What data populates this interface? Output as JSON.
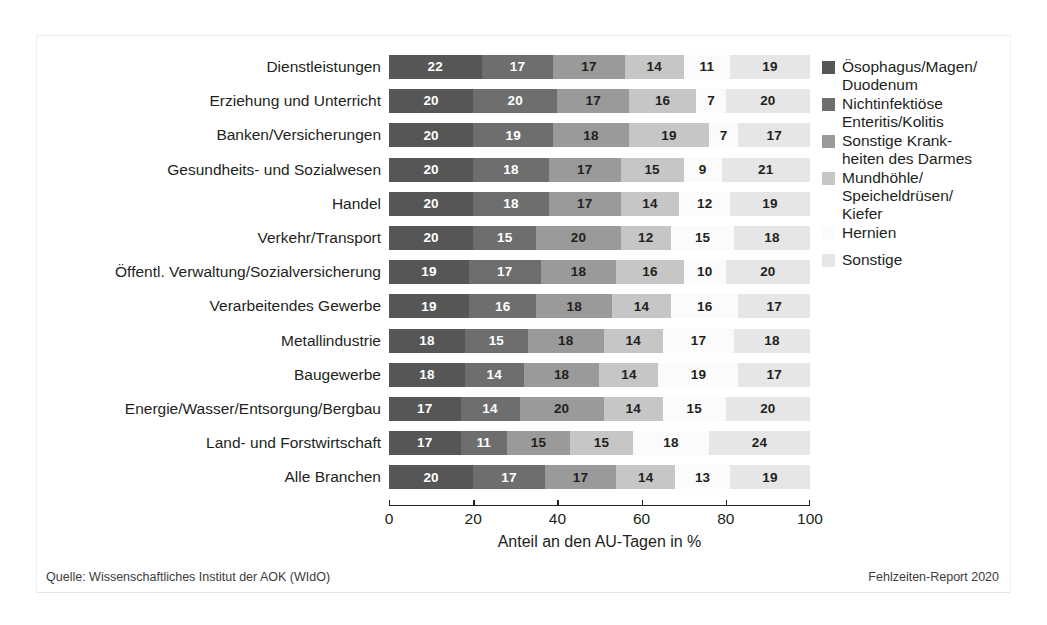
{
  "chart_data": {
    "type": "bar",
    "orientation": "horizontal",
    "stacked": true,
    "stack_mode": "percent",
    "title": "",
    "xlabel": "Anteil an den AU-Tagen in %",
    "ylabel": "",
    "xlim": [
      0,
      100
    ],
    "xticks": [
      0,
      20,
      40,
      60,
      80,
      100
    ],
    "xtick_labels": [
      "0",
      "20",
      "40",
      "60",
      "80",
      "100"
    ],
    "grid": false,
    "legend_position": "right",
    "categories": [
      "Dienstleistungen",
      "Erziehung und Unterricht",
      "Banken/Versicherungen",
      "Gesundheits- und Sozialwesen",
      "Handel",
      "Verkehr/Transport",
      "Öffentl. Verwaltung/Sozialversicherung",
      "Verarbeitendes Gewerbe",
      "Metallindustrie",
      "Baugewerbe",
      "Energie/Wasser/Entsorgung/Bergbau",
      "Land- und Forstwirtschaft",
      "Alle Branchen"
    ],
    "series": [
      {
        "name": "Ösophagus/Magen/Duodenum",
        "legend_label": "Ösophagus/Magen/\nDuodenum",
        "color": "#565656",
        "label_color": "#ffffff",
        "values": [
          22,
          20,
          20,
          20,
          20,
          20,
          19,
          19,
          18,
          18,
          17,
          17,
          20
        ]
      },
      {
        "name": "Nichtinfektiöse Enteritis/Kolitis",
        "legend_label": "Nichtinfektiöse\nEnteritis/Kolitis",
        "color": "#6e6e6e",
        "label_color": "#ffffff",
        "values": [
          17,
          20,
          19,
          18,
          18,
          15,
          17,
          16,
          15,
          14,
          14,
          11,
          17
        ]
      },
      {
        "name": "Sonstige Krankheiten des Darmes",
        "legend_label": "Sonstige Krank-\nheiten des Darmes",
        "color": "#9a9a9a",
        "label_color": "#231f20",
        "values": [
          17,
          17,
          18,
          17,
          17,
          20,
          18,
          18,
          18,
          18,
          20,
          15,
          17
        ]
      },
      {
        "name": "Mundhöhle/Speicheldrüsen/Kiefer",
        "legend_label": "Mundhöhle/\nSpeicheldrüsen/\nKiefer",
        "color": "#c6c6c6",
        "label_color": "#231f20",
        "values": [
          14,
          16,
          19,
          15,
          14,
          12,
          16,
          14,
          14,
          14,
          14,
          15,
          14
        ]
      },
      {
        "name": "Hernien",
        "legend_label": "Hernien",
        "color": "#fbfbfb",
        "label_color": "#231f20",
        "values": [
          11,
          7,
          7,
          9,
          12,
          15,
          10,
          16,
          17,
          19,
          15,
          18,
          13
        ]
      },
      {
        "name": "Sonstige",
        "legend_label": "Sonstige",
        "color": "#e6e6e6",
        "label_color": "#231f20",
        "values": [
          19,
          20,
          17,
          21,
          19,
          18,
          20,
          17,
          18,
          17,
          20,
          24,
          19
        ]
      }
    ]
  },
  "footer": {
    "source": "Quelle: Wissenschaftliches Institut der AOK (WIdO)",
    "report": "Fehlzeiten-Report 2020"
  }
}
